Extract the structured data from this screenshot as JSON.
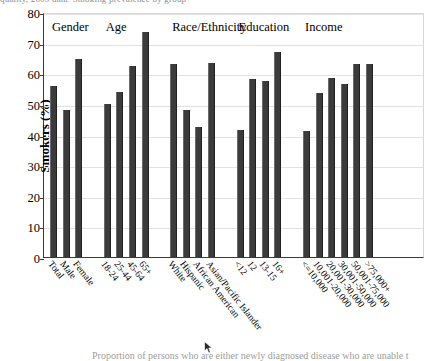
{
  "figure": {
    "top_clipped_text": "quality, 2005 data. Smoking prevalence by group",
    "bottom_clipped_text": "Proportion of persons who are either newly diagnosed disease who are unable t",
    "cursor_icon": "mouse-pointer-icon"
  },
  "chart_data": {
    "type": "bar",
    "title": "",
    "xlabel": "",
    "ylabel": "Smokers (%)",
    "ylim": [
      0,
      80
    ],
    "yticks": [
      0,
      10,
      20,
      30,
      40,
      50,
      60,
      70,
      80
    ],
    "grid": true,
    "legend_position": "none",
    "bar_color": "#3b3b3b",
    "group_headers": [
      "Gender",
      "Age",
      "Race/Ethnicity",
      "Education",
      "Income"
    ],
    "groups": [
      {
        "name": "Gender",
        "categories": [
          "Total",
          "Male",
          "Female"
        ],
        "values": [
          56,
          48,
          64.5
        ]
      },
      {
        "name": "Age",
        "categories": [
          "18-24",
          "25-44",
          "45-64",
          "65+"
        ],
        "values": [
          50,
          54,
          62.5,
          73.5
        ]
      },
      {
        "name": "Race/Ethnicity",
        "categories": [
          "White",
          "Hispanic",
          "African American",
          "Asian/Pacific Islander"
        ],
        "values": [
          63,
          48,
          42.5,
          63.5
        ]
      },
      {
        "name": "Education",
        "categories": [
          "<12",
          "12",
          "13-15",
          "16+"
        ],
        "values": [
          41.5,
          58,
          57.5,
          67
        ]
      },
      {
        "name": "Income",
        "categories": [
          "<=10,000",
          "10,001-20,000",
          "20,001-30,000",
          "30,001-50,000",
          "50,001-75,000",
          ">75,000+"
        ],
        "values": [
          41,
          53.5,
          58.5,
          56.5,
          63,
          63
        ]
      }
    ],
    "categories": [
      "Total",
      "Male",
      "Female",
      "18-24",
      "25-44",
      "45-64",
      "65+",
      "White",
      "Hispanic",
      "African American",
      "Asian/Pacific Islander",
      "<12",
      "12",
      "13-15",
      "16+",
      "<=10,000",
      "10,001-20,000",
      "20,001-30,000",
      "30,001-50,000",
      "50,001-75,000",
      ">75,000+"
    ],
    "values": [
      56,
      48,
      64.5,
      50,
      54,
      62.5,
      73.5,
      63,
      48,
      42.5,
      63.5,
      41.5,
      58,
      57.5,
      67,
      41,
      53.5,
      58.5,
      56.5,
      63,
      63
    ]
  }
}
